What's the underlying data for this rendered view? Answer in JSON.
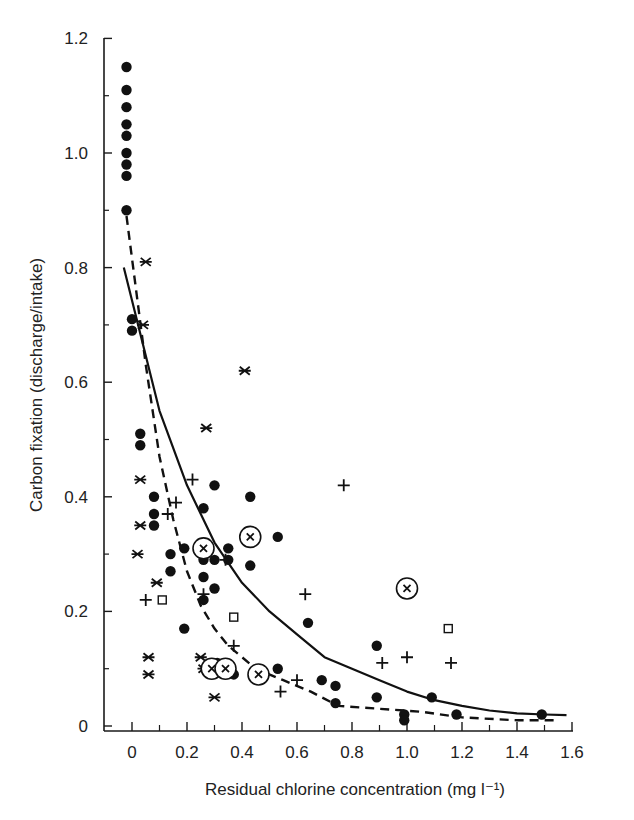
{
  "chart_data": {
    "type": "scatter",
    "title": "",
    "xlabel": "Residual chlorine concentration (mg l⁻¹)",
    "ylabel": "Carbon fixation (discharge/intake)",
    "xlim": [
      -0.1,
      1.6
    ],
    "ylim": [
      0,
      1.2
    ],
    "x_ticks": [
      "0",
      "0.2",
      "0.4",
      "0.6",
      "0.8",
      "1.0",
      "1.2",
      "1.4",
      "1.6"
    ],
    "y_ticks": [
      "0",
      "0.2",
      "0.4",
      "0.6",
      "0.8",
      "1.0",
      "1.2"
    ],
    "grid": false,
    "legend": null,
    "series": [
      {
        "name": "filled-circle",
        "marker": "circle-filled",
        "points": [
          [
            -0.02,
            1.15
          ],
          [
            -0.02,
            1.11
          ],
          [
            -0.02,
            1.08
          ],
          [
            -0.02,
            1.05
          ],
          [
            -0.02,
            1.03
          ],
          [
            -0.02,
            1.0
          ],
          [
            -0.02,
            0.98
          ],
          [
            -0.02,
            0.96
          ],
          [
            -0.02,
            0.9
          ],
          [
            0.0,
            0.71
          ],
          [
            0.0,
            0.69
          ],
          [
            0.03,
            0.51
          ],
          [
            0.03,
            0.49
          ],
          [
            0.08,
            0.4
          ],
          [
            0.08,
            0.37
          ],
          [
            0.08,
            0.35
          ],
          [
            0.14,
            0.3
          ],
          [
            0.14,
            0.27
          ],
          [
            0.19,
            0.31
          ],
          [
            0.19,
            0.17
          ],
          [
            0.26,
            0.38
          ],
          [
            0.26,
            0.29
          ],
          [
            0.26,
            0.26
          ],
          [
            0.26,
            0.22
          ],
          [
            0.3,
            0.42
          ],
          [
            0.3,
            0.29
          ],
          [
            0.3,
            0.24
          ],
          [
            0.31,
            0.11
          ],
          [
            0.35,
            0.31
          ],
          [
            0.35,
            0.29
          ],
          [
            0.37,
            0.09
          ],
          [
            0.43,
            0.4
          ],
          [
            0.43,
            0.28
          ],
          [
            0.53,
            0.33
          ],
          [
            0.53,
            0.1
          ],
          [
            0.64,
            0.18
          ],
          [
            0.69,
            0.08
          ],
          [
            0.74,
            0.07
          ],
          [
            0.74,
            0.04
          ],
          [
            0.89,
            0.14
          ],
          [
            0.89,
            0.05
          ],
          [
            0.99,
            0.02
          ],
          [
            0.99,
            0.01
          ],
          [
            1.09,
            0.05
          ],
          [
            1.18,
            0.02
          ],
          [
            1.49,
            0.02
          ]
        ]
      },
      {
        "name": "plus",
        "marker": "plus",
        "points": [
          [
            0.05,
            0.22
          ],
          [
            0.13,
            0.37
          ],
          [
            0.16,
            0.39
          ],
          [
            0.22,
            0.43
          ],
          [
            0.26,
            0.23
          ],
          [
            0.34,
            0.29
          ],
          [
            0.37,
            0.14
          ],
          [
            0.54,
            0.06
          ],
          [
            0.6,
            0.08
          ],
          [
            0.63,
            0.23
          ],
          [
            0.77,
            0.42
          ],
          [
            0.91,
            0.11
          ],
          [
            1.0,
            0.12
          ],
          [
            1.16,
            0.11
          ]
        ]
      },
      {
        "name": "asterisk",
        "marker": "asterisk",
        "points": [
          [
            0.05,
            0.81
          ],
          [
            0.04,
            0.7
          ],
          [
            0.03,
            0.43
          ],
          [
            0.03,
            0.35
          ],
          [
            0.02,
            0.3
          ],
          [
            0.06,
            0.12
          ],
          [
            0.06,
            0.09
          ],
          [
            0.09,
            0.25
          ],
          [
            0.27,
            0.52
          ],
          [
            0.41,
            0.62
          ],
          [
            0.25,
            0.12
          ],
          [
            0.26,
            0.1
          ],
          [
            0.3,
            0.05
          ]
        ]
      },
      {
        "name": "circled-x",
        "marker": "circled-x",
        "points": [
          [
            0.26,
            0.31
          ],
          [
            0.43,
            0.33
          ],
          [
            0.29,
            0.1
          ],
          [
            0.34,
            0.1
          ],
          [
            0.46,
            0.09
          ],
          [
            1.0,
            0.24
          ]
        ]
      },
      {
        "name": "open-square",
        "marker": "square-open",
        "points": [
          [
            0.11,
            0.22
          ],
          [
            0.37,
            0.19
          ],
          [
            1.15,
            0.17
          ]
        ]
      }
    ],
    "curves": [
      {
        "name": "solid-fit",
        "style": "solid",
        "points": [
          [
            -0.03,
            0.8
          ],
          [
            0.1,
            0.55
          ],
          [
            0.2,
            0.42
          ],
          [
            0.3,
            0.32
          ],
          [
            0.4,
            0.25
          ],
          [
            0.5,
            0.2
          ],
          [
            0.6,
            0.16
          ],
          [
            0.7,
            0.12
          ],
          [
            0.8,
            0.1
          ],
          [
            0.9,
            0.08
          ],
          [
            1.0,
            0.06
          ],
          [
            1.1,
            0.045
          ],
          [
            1.2,
            0.035
          ],
          [
            1.3,
            0.027
          ],
          [
            1.4,
            0.022
          ],
          [
            1.5,
            0.02
          ],
          [
            1.58,
            0.019
          ]
        ]
      },
      {
        "name": "dashed-fit",
        "style": "dashed",
        "points": [
          [
            -0.02,
            0.89
          ],
          [
            0.05,
            0.63
          ],
          [
            0.1,
            0.47
          ],
          [
            0.15,
            0.36
          ],
          [
            0.2,
            0.27
          ],
          [
            0.25,
            0.21
          ],
          [
            0.3,
            0.17
          ],
          [
            0.35,
            0.14
          ],
          [
            0.4,
            0.12
          ],
          [
            0.45,
            0.1
          ],
          [
            0.55,
            0.08
          ],
          [
            0.65,
            0.06
          ],
          [
            0.75,
            0.035
          ],
          [
            0.9,
            0.03
          ],
          [
            1.05,
            0.025
          ],
          [
            1.2,
            0.015
          ],
          [
            1.4,
            0.01
          ],
          [
            1.55,
            0.01
          ]
        ]
      }
    ]
  }
}
